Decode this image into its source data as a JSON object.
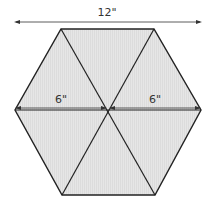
{
  "diagram": {
    "shape": "hexagon",
    "triangles": 6,
    "fill_color": "#e4e4e4",
    "stroke_color": "#222222",
    "dimensions": {
      "overall_width_label": "12\"",
      "left_half_label": "6\"",
      "right_half_label": "6\""
    }
  }
}
